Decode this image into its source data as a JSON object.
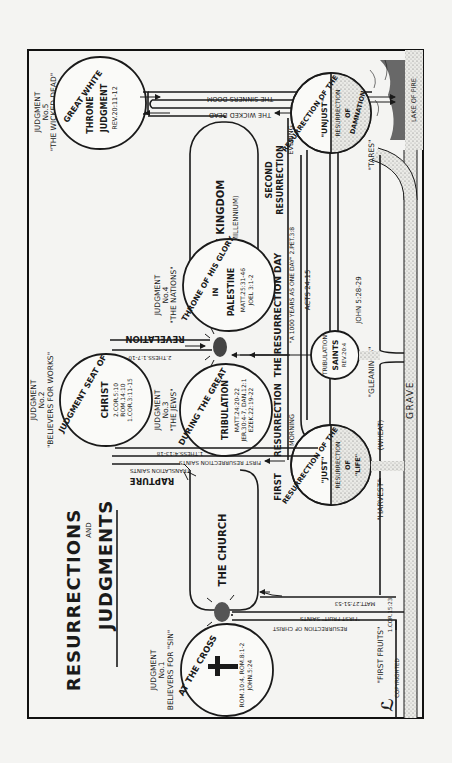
{
  "title": {
    "line1": "RESURRECTIONS",
    "line2": "AND",
    "line3": "JUDGMENTS"
  },
  "judgments": [
    {
      "id": 1,
      "heading": "JUDGMENT",
      "number": "No.1",
      "subject": "BELIEVERS FOR \"SIN\"",
      "circle_text": "AT THE CROSS",
      "refs": [
        "ROM.10:4, ROM.8:1-2",
        "JOHN.5:24"
      ]
    },
    {
      "id": 2,
      "heading": "JUDGMENT",
      "number": "No.2",
      "subject": "\"BELIEVERS FOR WORKS\"",
      "circle_text": "JUDGMENT SEAT OF",
      "circle_name": "CHRIST",
      "refs": [
        "2.COR.5:10",
        "ROM.14:10",
        "1.COR.3:11-15"
      ]
    },
    {
      "id": 3,
      "heading": "JUDGMENT",
      "number": "No.3",
      "subject": "\"THE JEWS\"",
      "circle_text": "DURING THE GREAT",
      "circle_name": "TRIBULATION",
      "refs": [
        "MATT.24:20-22",
        "JER.30:4-7, DAN.12:1",
        "EZEK.22:19-22"
      ]
    },
    {
      "id": 4,
      "heading": "JUDGMENT",
      "number": "No.4",
      "subject": "\"THE NATIONS\"",
      "circle_text": "THRONE OF HIS GLORY",
      "circle_sub": "IN",
      "circle_name": "PALESTINE",
      "refs": [
        "MATT.25:31-46",
        "JOEL 3:1-2"
      ]
    },
    {
      "id": 5,
      "heading": "JUDGMENT",
      "number": "No.5",
      "subject": "\"THE WICKED DEAD\"",
      "circle_text": "GREAT WHITE",
      "circle_name": "THRONE",
      "circle_sub": "JUDGMENT",
      "refs": [
        "REV.20:11-12"
      ]
    }
  ],
  "resurrections": {
    "just": {
      "outer": "RESURRECTION OF THE",
      "name": "\"JUST\"",
      "inner": [
        "RESURRECTION",
        "OF",
        "\"LIFE\""
      ]
    },
    "unjust": {
      "outer": "RESURRECTION OF THE",
      "name": "\"UNJUST\"",
      "inner": [
        "RESURRECTION",
        "OF",
        "DAMNATION"
      ]
    },
    "tribulation_saints": {
      "line1": "TRIBULATION",
      "line2": "SAINTS",
      "ref": "REV.20:4"
    }
  },
  "labels": {
    "the_church": "THE CHURCH",
    "the_kingdom": "THE KINGDOM",
    "millennium": "(MILLENNIUM)",
    "rapture": "RAPTURE",
    "revelation": "REVELATION",
    "translation_saints": "TRANSLATION SAINTS",
    "first_resurrection_saints": "FIRST RESURRECTION SAINTS",
    "thess_4": "1.THESS.4:13-18",
    "thess_1": "2.THESS.1:7-10",
    "first_fruit_saints": "\"FIRST FRUIT\" SAINTS",
    "matt_27": "MATT.27:51-53",
    "resurrection_of_christ": "RESURRECTION OF CHRIST",
    "first_resurrection": "FIRST",
    "resurrection_word": "RESURRECTION",
    "morning": "MORNING",
    "second": "SECOND",
    "second_resurrection": "RESURRECTION",
    "evening": "EVENING",
    "resurrection_day": "THE RESURRECTION DAY",
    "thousand_years": "\"A 1000 YEARS AS ONE DAY\" 2.PET.3:8",
    "acts": "ACTS 24:15",
    "john": "JOHN 5:28-29",
    "the_wicked_dead": "THE WICKED DEAD",
    "the_sinners_doom": "THE SINNERS DOOM",
    "lake_of_fire": "LAKE OF FIRE",
    "grave": "GRAVE",
    "first_fruits": "\"FIRST FRUITS\"",
    "first_fruits_ref": "1.COR.15:23",
    "harvest": "\"HARVEST\"",
    "wheat": "(WHEAT)",
    "gleanings": "\"GLEANINGS\"",
    "tares": "\"TARES\"",
    "copyrighted": "COPYRIGHTED"
  },
  "icons": [
    "cross-icon",
    "rising-sun-icon",
    "fire-icon",
    "copyright-monogram-icon"
  ],
  "colors": {
    "ink": "#1a1a1a",
    "paper": "#f4f4f2",
    "stipple": "#9a9a9a"
  }
}
